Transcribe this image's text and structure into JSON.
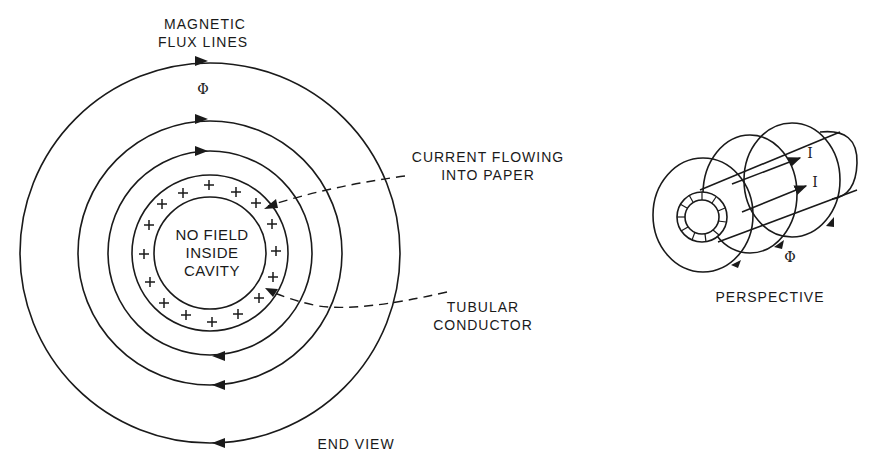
{
  "diagram": {
    "end_view": {
      "label": "END VIEW",
      "flux_label_line1": "MAGNETIC",
      "flux_label_line2": "FLUX LINES",
      "flux_symbol": "Φ",
      "cavity_line1": "NO FIELD",
      "cavity_line2": "INSIDE",
      "cavity_line3": "CAVITY",
      "current_label_line1": "CURRENT FLOWING",
      "current_label_line2": "INTO PAPER",
      "conductor_label_line1": "TUBULAR",
      "conductor_label_line2": "CONDUCTOR",
      "charge_symbol": "+",
      "charge_count": 16,
      "flux_circle_count": 3
    },
    "perspective_view": {
      "label": "PERSPECTIVE",
      "current_symbol_1": "I",
      "current_symbol_2": "I",
      "flux_symbol": "Φ"
    },
    "colors": {
      "line": "#1a1a1a",
      "background": "#ffffff"
    }
  }
}
